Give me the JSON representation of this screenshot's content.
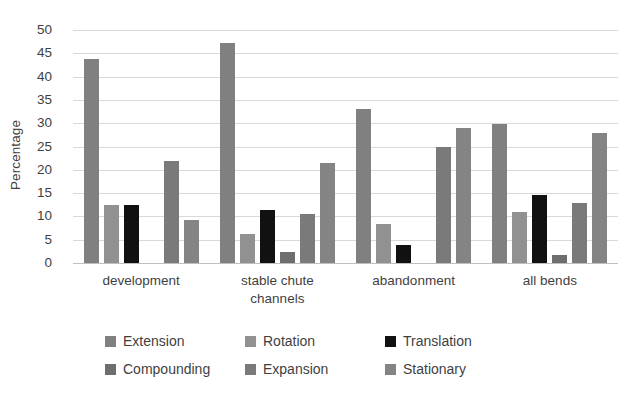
{
  "chart_data": {
    "type": "bar",
    "title": "",
    "xlabel": "",
    "ylabel": "Percentage",
    "ylim": [
      0,
      50
    ],
    "yticks": [
      0,
      5,
      10,
      15,
      20,
      25,
      30,
      35,
      40,
      45,
      50
    ],
    "grid": true,
    "legend_position": "bottom",
    "categories": [
      "development",
      "stable chute\nchannels",
      "abandonment",
      "all bends"
    ],
    "category_lines": [
      [
        "development"
      ],
      [
        "stable chute",
        "channels"
      ],
      [
        "abandonment"
      ],
      [
        "all bends"
      ]
    ],
    "series": [
      {
        "name": "Extension",
        "color": "#808080",
        "values": [
          43.8,
          47.3,
          33.0,
          29.9
        ]
      },
      {
        "name": "Rotation",
        "color": "#919191",
        "values": [
          12.5,
          6.3,
          8.4,
          11.0
        ]
      },
      {
        "name": "Translation",
        "color": "#111111",
        "values": [
          12.4,
          11.3,
          3.9,
          14.6
        ]
      },
      {
        "name": "Compounding",
        "color": "#6e6e6e",
        "values": [
          0,
          2.3,
          0,
          1.8
        ]
      },
      {
        "name": "Expansion",
        "color": "#7a7a7a",
        "values": [
          21.8,
          10.5,
          24.8,
          12.9
        ]
      },
      {
        "name": "Stationary",
        "color": "#848484",
        "values": [
          9.3,
          21.4,
          28.9,
          27.8
        ]
      }
    ]
  },
  "axis": {
    "y_title": "Percentage"
  }
}
